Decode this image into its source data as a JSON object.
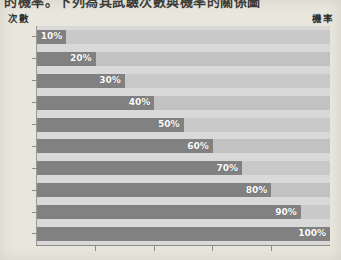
{
  "title": "的機率。下列為其試驗次數與機率的關係圖",
  "axis": {
    "left_header": "次數",
    "right_header": "機率"
  },
  "colors": {
    "background": "#e9e6dd",
    "bar_fill": "#818181",
    "track": "#c6c6c6",
    "axis_line": "#8c8c88",
    "label_text": "#2f2f2d",
    "value_text": "#ffffff"
  },
  "chart_data": {
    "type": "bar",
    "orientation": "horizontal",
    "title": "的機率。下列為其試驗次數與機率的關係圖",
    "xlabel": "機率",
    "ylabel": "次數",
    "categories": [
      "10次",
      "20次",
      "30次",
      "40次",
      "50次",
      "60次",
      "70次",
      "80次",
      "90次",
      "100次"
    ],
    "values": [
      10,
      20,
      30,
      40,
      50,
      60,
      70,
      80,
      90,
      100
    ],
    "value_labels": [
      "10%",
      "20%",
      "30%",
      "40%",
      "50%",
      "60%",
      "70%",
      "80%",
      "90%",
      "100%"
    ],
    "xlim": [
      0,
      100
    ],
    "grid": false,
    "legend": false,
    "x_tick_positions": [
      20,
      40,
      60,
      80
    ],
    "x_tick_labels": [
      "",
      "",
      "",
      ""
    ]
  }
}
